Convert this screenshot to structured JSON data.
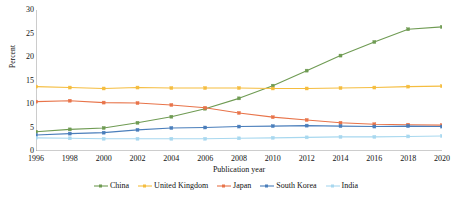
{
  "chart_data": {
    "type": "line",
    "title": "",
    "xlabel": "Publication year",
    "ylabel": "Percent",
    "xlim": [
      1996,
      2020
    ],
    "ylim": [
      0,
      30
    ],
    "ytick_values": [
      0,
      5,
      10,
      15,
      20,
      25,
      30
    ],
    "xtick_labels": [
      "1996",
      "1998",
      "2000",
      "2002",
      "2004",
      "2006",
      "2008",
      "2010",
      "2012",
      "2014",
      "2016",
      "2018",
      "2020"
    ],
    "x": [
      1996,
      1998,
      2000,
      2002,
      2004,
      2006,
      2008,
      2010,
      2012,
      2014,
      2016,
      2018,
      2020
    ],
    "grid": false,
    "legend_position": "bottom",
    "series": [
      {
        "name": "China",
        "color": "#6f9b53",
        "marker": "square",
        "values": [
          4.1,
          4.6,
          4.9,
          6.0,
          7.3,
          9.0,
          11.2,
          13.9,
          17.1,
          20.3,
          23.2,
          25.9,
          26.4
        ]
      },
      {
        "name": "United Kingdom",
        "color": "#f5bd3f",
        "marker": "square",
        "values": [
          13.7,
          13.5,
          13.3,
          13.5,
          13.4,
          13.4,
          13.4,
          13.3,
          13.3,
          13.4,
          13.5,
          13.7,
          13.8
        ]
      },
      {
        "name": "Japan",
        "color": "#e8744a",
        "marker": "square",
        "values": [
          10.5,
          10.7,
          10.3,
          10.2,
          9.8,
          9.2,
          8.1,
          7.2,
          6.6,
          6.0,
          5.7,
          5.6,
          5.5
        ]
      },
      {
        "name": "South Korea",
        "color": "#4a7ebb",
        "marker": "square",
        "values": [
          3.4,
          3.7,
          3.9,
          4.5,
          4.9,
          5.0,
          5.2,
          5.3,
          5.4,
          5.3,
          5.2,
          5.3,
          5.2
        ]
      },
      {
        "name": "India",
        "color": "#a8d8ef",
        "marker": "square",
        "values": [
          2.8,
          2.7,
          2.6,
          2.6,
          2.6,
          2.6,
          2.7,
          2.8,
          2.9,
          3.0,
          3.0,
          3.1,
          3.2
        ]
      }
    ]
  }
}
